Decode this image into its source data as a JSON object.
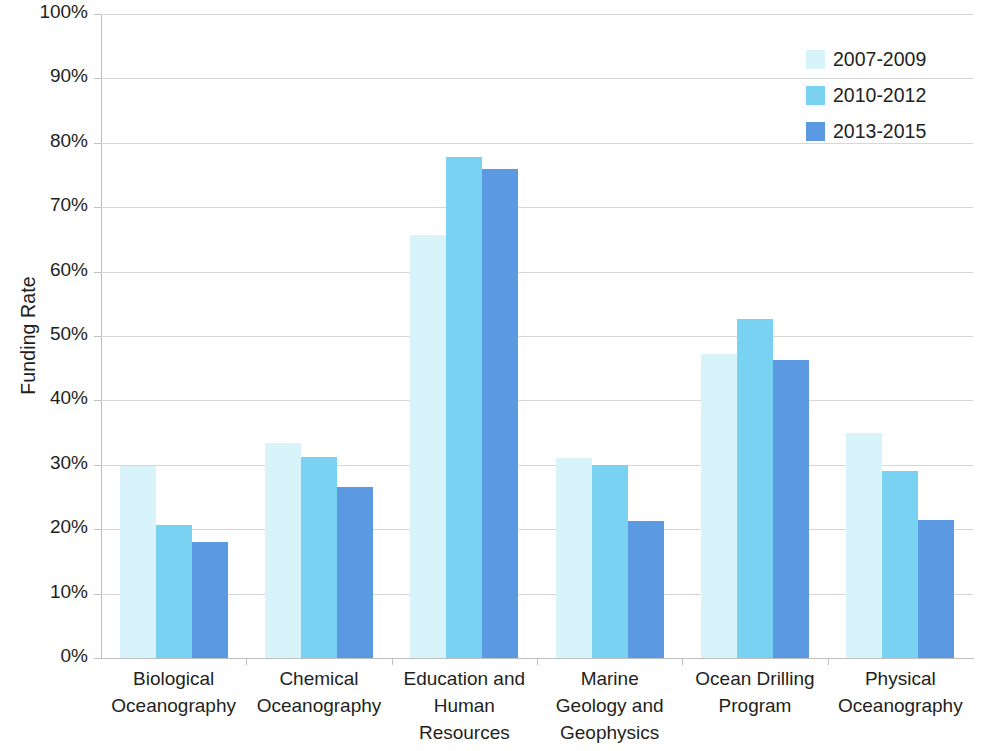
{
  "chart_data": {
    "type": "bar",
    "title": "",
    "subtitle": "",
    "xlabel": "",
    "ylabel": "Funding Rate",
    "ylim": [
      0,
      100
    ],
    "y_unit": "%",
    "grid": true,
    "grid_axis": "y",
    "legend_position": "top-right",
    "orientation": "vertical",
    "bar_grouping": "grouped",
    "categories": [
      "Biological Oceanography",
      "Chemical Oceanography",
      "Education and Human Resources",
      "Marine Geology and Geophysics",
      "Ocean Drilling Program",
      "Physical Oceanography"
    ],
    "category_lines": [
      [
        "Biological",
        "Oceanography"
      ],
      [
        "Chemical",
        "Oceanography"
      ],
      [
        "Education and",
        "Human",
        "Resources"
      ],
      [
        "Marine",
        "Geology and",
        "Geophysics"
      ],
      [
        "Ocean Drilling",
        "Program"
      ],
      [
        "Physical",
        "Oceanography"
      ]
    ],
    "yticks": [
      0,
      10,
      20,
      30,
      40,
      50,
      60,
      70,
      80,
      90,
      100
    ],
    "ytick_labels": [
      "0%",
      "10%",
      "20%",
      "30%",
      "40%",
      "50%",
      "60%",
      "70%",
      "80%",
      "90%",
      "100%"
    ],
    "series": [
      {
        "name": "2007-2009",
        "color": "#d9f3fb",
        "values": [
          29.8,
          33.4,
          65.7,
          31.0,
          47.2,
          34.9
        ]
      },
      {
        "name": "2010-2012",
        "color": "#79d2f2",
        "values": [
          20.7,
          31.2,
          77.8,
          30.0,
          52.6,
          29.0
        ]
      },
      {
        "name": "2013-2015",
        "color": "#5b9ae3",
        "values": [
          18.0,
          26.5,
          75.9,
          21.3,
          46.2,
          21.4
        ]
      }
    ]
  },
  "legend": {
    "entries": [
      {
        "label": "2007-2009",
        "color": "#d9f3fb"
      },
      {
        "label": "2010-2012",
        "color": "#79d2f2"
      },
      {
        "label": "2013-2015",
        "color": "#5b9ae3"
      }
    ]
  },
  "axes": {
    "y_title": "Funding Rate"
  },
  "colors": {
    "gridline": "#d6d7d9",
    "axis": "#bcbec0",
    "text": "#231f20",
    "background": "#ffffff"
  }
}
